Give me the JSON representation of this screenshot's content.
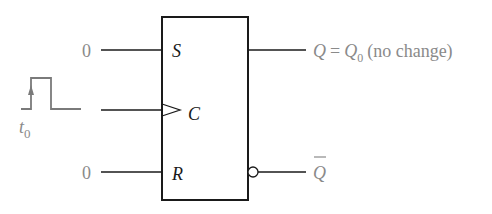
{
  "diagram": {
    "colors": {
      "line": "#1a1a1a",
      "annotation": "#8a8a8a"
    },
    "inputs": {
      "S": {
        "pin_label": "S",
        "value": "0"
      },
      "C": {
        "pin_label": "C",
        "clock_label": "t",
        "clock_subscript": "0"
      },
      "R": {
        "pin_label": "R",
        "value": "0"
      }
    },
    "outputs": {
      "Q": {
        "label": "Q",
        "eq": "=",
        "rhs": "Q",
        "rhs_subscript": "0",
        "note": "(no change)"
      },
      "Qbar": {
        "label": "Q"
      }
    }
  }
}
